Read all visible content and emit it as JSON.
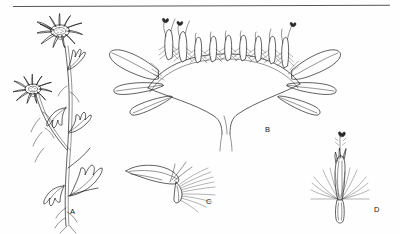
{
  "plate": {
    "title": "Botanical illustration plate",
    "background_color": "#fefefe",
    "ink_color": "#1d1d1d",
    "rule_color": "#555555",
    "width": 400,
    "height": 234,
    "top_rule": {
      "x1": 13,
      "y1": 6,
      "x2": 390,
      "y2": 5
    }
  },
  "panels": [
    {
      "id": "A",
      "label": "A",
      "label_x": 70,
      "label_y": 214,
      "subject": "habit-whole-plant",
      "description": "Flowering stem with two radiate capitula, branched stem and pinnately lobed leaves"
    },
    {
      "id": "B",
      "label": "B",
      "label_x": 265,
      "label_y": 132,
      "subject": "capitulum-longitudinal-section",
      "description": "Longitudinal section of the flower head showing convex receptacle, disc florets and spreading ray florets"
    },
    {
      "id": "C",
      "label": "C",
      "label_x": 206,
      "label_y": 204,
      "subject": "ray-floret",
      "description": "Single ray floret with ligule, pappus bristles and ovary"
    },
    {
      "id": "D",
      "label": "D",
      "label_x": 374,
      "label_y": 212,
      "subject": "disc-floret",
      "description": "Single disc floret with tubular corolla, exserted style and pappus bristles"
    }
  ]
}
